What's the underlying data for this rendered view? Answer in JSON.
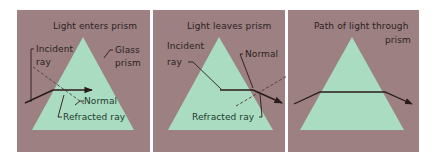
{
  "colors": {
    "panel_background": "#9d8081",
    "prism_fill": "#a9dcc0",
    "ray": "#2a1a1a",
    "label_text": "#2a1f1f",
    "page_background": "#ffffff"
  },
  "panels": [
    {
      "title": "Light enters prism",
      "labels": {
        "incident_line1": "Incident",
        "incident_line2": "ray",
        "glass_line1": "Glass",
        "glass_line2": "prism",
        "normal": "Normal",
        "refracted": "Refracted ray"
      }
    },
    {
      "title": "Light leaves prism",
      "labels": {
        "incident_line1": "Incident",
        "incident_line2": "ray",
        "normal": "Normal",
        "refracted": "Refracted ray"
      }
    },
    {
      "title_line1": "Path of light through",
      "title_line2": "prism"
    }
  ]
}
